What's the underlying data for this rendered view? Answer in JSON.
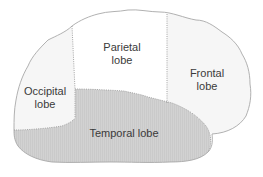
{
  "diagram": {
    "colors": {
      "outline": "#a8a8a8",
      "divider": "#9a9a9a",
      "occipital_fill": "#f6f6f6",
      "parietal_fill": "#ffffff",
      "frontal_fill": "#f6f6f6",
      "temporal_fill": "#d2d2d2",
      "text": "#3a3a3a"
    },
    "lobes": [
      {
        "id": "parietal",
        "line1": "Parietal",
        "line2": "lobe"
      },
      {
        "id": "frontal",
        "line1": "Frontal",
        "line2": "lobe"
      },
      {
        "id": "occipital",
        "line1": "Occipital",
        "line2": "lobe"
      },
      {
        "id": "temporal",
        "line1": "Temporal lobe"
      }
    ]
  }
}
